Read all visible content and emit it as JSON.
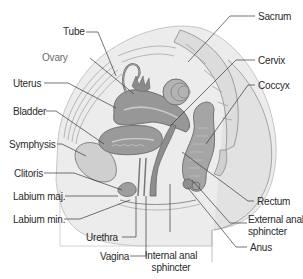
{
  "diagram": {
    "colors": {
      "organ_fill": "#9a9a9a",
      "organ_dark": "#7d7d7d",
      "bone_fill": "#d6d6d6",
      "soft_tissue": "#e4e4e4",
      "outline": "#6f6f6f",
      "leader_line": "#3a3a3a",
      "label_text": "#2a2a2a"
    },
    "labels_left": [
      {
        "id": "tube",
        "text": "Tube"
      },
      {
        "id": "ovary",
        "text": "Ovary"
      },
      {
        "id": "uterus",
        "text": "Uterus"
      },
      {
        "id": "bladder",
        "text": "Bladder"
      },
      {
        "id": "symphysis",
        "text": "Symphysis"
      },
      {
        "id": "clitoris",
        "text": "Clitoris"
      },
      {
        "id": "labium_maj",
        "text": "Labium maj."
      },
      {
        "id": "labium_min",
        "text": "Labium min."
      }
    ],
    "labels_right": [
      {
        "id": "sacrum",
        "text": "Sacrum"
      },
      {
        "id": "cervix",
        "text": "Cervix"
      },
      {
        "id": "coccyx",
        "text": "Coccyx"
      },
      {
        "id": "rectum",
        "text": "Rectum"
      },
      {
        "id": "external_anal_sphincter",
        "text_line1": "External anal",
        "text_line2": "sphincter"
      },
      {
        "id": "anus",
        "text": "Anus"
      }
    ],
    "labels_bottom": [
      {
        "id": "urethra",
        "text": "Urethra"
      },
      {
        "id": "vagina",
        "text": "Vagina"
      },
      {
        "id": "internal_anal_sphincter",
        "text_line1": "Internal anal",
        "text_line2": "sphincter"
      }
    ]
  }
}
